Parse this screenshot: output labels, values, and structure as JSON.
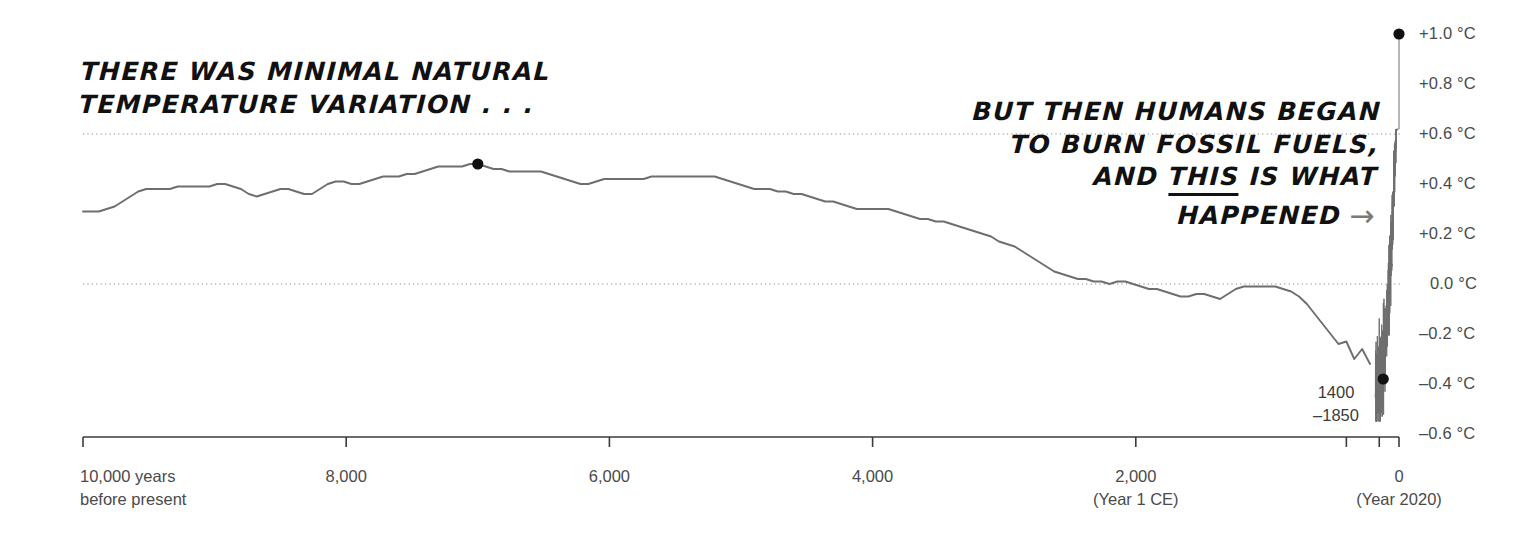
{
  "annotations": {
    "left": {
      "lines": [
        "THERE WAS MINIMAL NATURAL",
        "TEMPERATURE VARIATION . . ."
      ]
    },
    "right": {
      "line1": "BUT THEN HUMANS BEGAN",
      "line2": "TO BURN FOSSIL FUELS,",
      "line3_a": "AND",
      "line3_underlined": "THIS",
      "line3_b": "IS WHAT",
      "line4": "HAPPENED",
      "arrow": "arrow-right-icon",
      "arrow_glyph": "→"
    }
  },
  "callout": {
    "little_ice_age": {
      "line1": "1400",
      "line2": "–1850",
      "value_c": -0.38,
      "x_years_bp": 120
    },
    "holocene_peak": {
      "value_c": 0.48,
      "x_years_bp": 7000
    },
    "present": {
      "label": "+1.0 °C",
      "value_c": 1.0,
      "x_years_bp": 0
    }
  },
  "chart_data": {
    "type": "line",
    "title": "",
    "subtitle": "",
    "xlabel": "",
    "ylabel": "",
    "grid": true,
    "gridlines_y": [
      0.6,
      0.0
    ],
    "legend": "none",
    "x_axis": {
      "direction": "reversed",
      "unit": "years before present",
      "xlim": [
        10000,
        0
      ],
      "ticks": [
        {
          "value": 10000,
          "label": "10,000 years",
          "sub": "before present"
        },
        {
          "value": 8000,
          "label": "8,000",
          "sub": ""
        },
        {
          "value": 6000,
          "label": "6,000",
          "sub": ""
        },
        {
          "value": 4000,
          "label": "4,000",
          "sub": ""
        },
        {
          "value": 2000,
          "label": "2,000",
          "sub": "(Year 1 CE)"
        },
        {
          "value": 0,
          "label": "0",
          "sub": "(Year 2020)"
        }
      ],
      "minor_ticks": [
        400,
        150
      ]
    },
    "y_axis": {
      "unit": "°C",
      "ylim": [
        -0.6,
        1.0
      ],
      "ticks": [
        {
          "value": 1.0,
          "label": "+1.0 °C"
        },
        {
          "value": 0.8,
          "label": "+0.8 °C"
        },
        {
          "value": 0.6,
          "label": "+0.6 °C"
        },
        {
          "value": 0.4,
          "label": "+0.4 °C"
        },
        {
          "value": 0.2,
          "label": "+0.2 °C"
        },
        {
          "value": 0.0,
          "label": "0.0 °C"
        },
        {
          "value": -0.2,
          "label": "–0.2 °C"
        },
        {
          "value": -0.4,
          "label": "–0.4 °C"
        },
        {
          "value": -0.6,
          "label": "–0.6 °C"
        }
      ]
    },
    "series": [
      {
        "name": "Reconstructed global temperature anomaly",
        "color": "#6e6e6e",
        "x": [
          10000,
          9940,
          9880,
          9820,
          9760,
          9700,
          9640,
          9580,
          9520,
          9460,
          9400,
          9340,
          9280,
          9220,
          9160,
          9100,
          9040,
          8980,
          8920,
          8860,
          8800,
          8740,
          8680,
          8620,
          8560,
          8500,
          8440,
          8380,
          8320,
          8260,
          8200,
          8140,
          8080,
          8020,
          7960,
          7900,
          7840,
          7780,
          7720,
          7660,
          7600,
          7540,
          7480,
          7420,
          7360,
          7300,
          7240,
          7180,
          7120,
          7060,
          7000,
          6940,
          6880,
          6820,
          6760,
          6700,
          6640,
          6580,
          6520,
          6460,
          6400,
          6340,
          6280,
          6220,
          6160,
          6100,
          6040,
          5980,
          5920,
          5860,
          5800,
          5740,
          5680,
          5620,
          5560,
          5500,
          5440,
          5380,
          5320,
          5260,
          5200,
          5140,
          5080,
          5020,
          4960,
          4900,
          4840,
          4780,
          4720,
          4660,
          4600,
          4540,
          4480,
          4420,
          4360,
          4300,
          4240,
          4180,
          4120,
          4060,
          4000,
          3940,
          3880,
          3820,
          3760,
          3700,
          3640,
          3580,
          3520,
          3460,
          3400,
          3340,
          3280,
          3220,
          3160,
          3100,
          3040,
          2980,
          2920,
          2860,
          2800,
          2740,
          2680,
          2620,
          2560,
          2500,
          2440,
          2380,
          2320,
          2260,
          2200,
          2140,
          2080,
          2020,
          1960,
          1900,
          1840,
          1780,
          1720,
          1660,
          1600,
          1540,
          1480,
          1420,
          1360,
          1300,
          1240,
          1180,
          1120,
          1060,
          1000,
          940,
          880,
          820,
          760,
          700,
          640,
          580,
          520,
          460,
          400,
          340,
          280,
          220,
          170,
          140,
          120,
          100,
          80,
          60,
          40,
          20,
          0
        ],
        "y": [
          0.29,
          0.29,
          0.29,
          0.3,
          0.31,
          0.33,
          0.35,
          0.37,
          0.38,
          0.38,
          0.38,
          0.38,
          0.39,
          0.39,
          0.39,
          0.39,
          0.39,
          0.4,
          0.4,
          0.39,
          0.38,
          0.36,
          0.35,
          0.36,
          0.37,
          0.38,
          0.38,
          0.37,
          0.36,
          0.36,
          0.38,
          0.4,
          0.41,
          0.41,
          0.4,
          0.4,
          0.41,
          0.42,
          0.43,
          0.43,
          0.43,
          0.44,
          0.44,
          0.45,
          0.46,
          0.47,
          0.47,
          0.47,
          0.47,
          0.48,
          0.48,
          0.47,
          0.46,
          0.46,
          0.45,
          0.45,
          0.45,
          0.45,
          0.45,
          0.44,
          0.43,
          0.42,
          0.41,
          0.4,
          0.4,
          0.41,
          0.42,
          0.42,
          0.42,
          0.42,
          0.42,
          0.42,
          0.43,
          0.43,
          0.43,
          0.43,
          0.43,
          0.43,
          0.43,
          0.43,
          0.43,
          0.42,
          0.41,
          0.4,
          0.39,
          0.38,
          0.38,
          0.38,
          0.37,
          0.37,
          0.36,
          0.36,
          0.35,
          0.34,
          0.33,
          0.33,
          0.32,
          0.31,
          0.3,
          0.3,
          0.3,
          0.3,
          0.3,
          0.29,
          0.28,
          0.27,
          0.26,
          0.26,
          0.25,
          0.25,
          0.24,
          0.23,
          0.22,
          0.21,
          0.2,
          0.19,
          0.17,
          0.16,
          0.15,
          0.13,
          0.11,
          0.09,
          0.07,
          0.05,
          0.04,
          0.03,
          0.02,
          0.02,
          0.01,
          0.01,
          0.0,
          0.01,
          0.01,
          0.0,
          -0.01,
          -0.02,
          -0.02,
          -0.03,
          -0.04,
          -0.05,
          -0.05,
          -0.04,
          -0.04,
          -0.05,
          -0.06,
          -0.04,
          -0.02,
          -0.01,
          -0.01,
          -0.01,
          -0.01,
          -0.01,
          -0.02,
          -0.03,
          -0.05,
          -0.08,
          -0.12,
          -0.16,
          -0.2,
          -0.24,
          -0.23,
          -0.3,
          -0.26,
          -0.32,
          -0.38,
          -0.28,
          -0.38,
          -0.2,
          0.0,
          0.15,
          0.32,
          0.55,
          1.0
        ]
      }
    ],
    "markers": [
      {
        "name": "holocene-peak-dot",
        "x": 7000,
        "y": 0.48,
        "color": "#111111"
      },
      {
        "name": "little-ice-age-dot",
        "x": 120,
        "y": -0.38,
        "color": "#111111"
      },
      {
        "name": "present-day-dot",
        "x": 0,
        "y": 1.0,
        "color": "#111111"
      }
    ],
    "modern_spike": {
      "description": "High-frequency instrumental-era oscillation rising steeply to +1.0 C",
      "x_start_years_bp": 180,
      "x_end_years_bp": 0,
      "y_min": -0.55,
      "y_max": 0.62
    }
  },
  "colors": {
    "line": "#6e6e6e",
    "axis": "#3b3b3b",
    "grid": "#8a8a8a",
    "marker": "#111111",
    "text": "#3b3b3b",
    "hand_text": "#111111",
    "arrow": "#7a7a7a",
    "background": "#ffffff"
  }
}
